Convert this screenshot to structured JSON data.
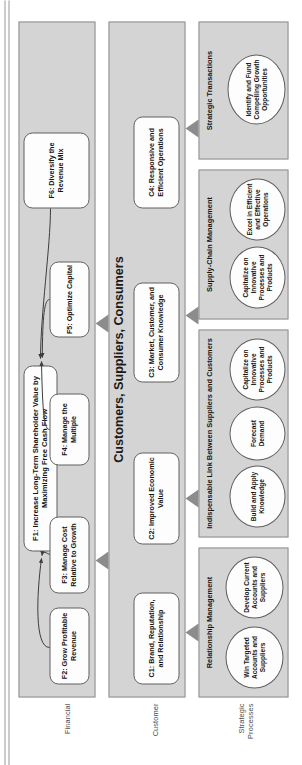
{
  "diagram": {
    "type": "strategy-map",
    "orientation": "rotated-90-ccw",
    "colors": {
      "band_fill": "#d4d4d4",
      "band_stroke": "#8e8e8e",
      "box_fill": "#fdfdfd",
      "box_stroke": "#5f5f5f",
      "arrow_fill": "#8c8c8c",
      "text": "#141414",
      "row_label_text": "#4d4d4d"
    }
  },
  "row_labels": [
    {
      "label": "Financial"
    },
    {
      "label": "Customer"
    },
    {
      "label": "Strategic\nProcesses"
    }
  ],
  "perspectives": {
    "financial": {
      "title": "",
      "objectives": [
        {
          "id": "F1",
          "label": "F1: Increase Long-Term Shareholder Value by Maximizing Free Cash Flow"
        },
        {
          "id": "F2",
          "label": "F2: Grow Profitable Revenue"
        },
        {
          "id": "F3",
          "label": "F3: Manage Cost Relative to Growth"
        },
        {
          "id": "F4",
          "label": "F4: Manage the Multiple"
        },
        {
          "id": "F5",
          "label": "F5: Optimize Capital"
        },
        {
          "id": "F6",
          "label": "F6: Diversify the Revenue Mix"
        }
      ]
    },
    "customer": {
      "title": "Customers, Suppliers, Consumers",
      "objectives": [
        {
          "id": "C1",
          "label": "C1: Brand, Reputation, and Relationship"
        },
        {
          "id": "C2",
          "label": "C2: Improved Economic Value"
        },
        {
          "id": "C3",
          "label": "C3: Market, Customer, and Consumer Knowledge"
        },
        {
          "id": "C4",
          "label": "C4: Responsive and Efficient Operations"
        }
      ]
    },
    "strategic_processes": {
      "title": "",
      "groups": [
        {
          "name": "Relationship Management",
          "items": [
            {
              "label": "Win Targeted Accounts and Suppliers"
            },
            {
              "label": "Develop Current Accounts and Suppliers"
            }
          ]
        },
        {
          "name": "Indispensable Link Between Suppliers and Customers",
          "items": [
            {
              "label": "Build and Apply Knowledge"
            },
            {
              "label": "Forecast Demand"
            },
            {
              "label": "Capitalize on Innovative Processes and Products"
            }
          ]
        },
        {
          "name": "Supply-Chain Management",
          "items": [
            {
              "label": "Capitalize on Innovative Processes and Products"
            },
            {
              "label": "Excel in Efficient and Effective Operations"
            }
          ]
        },
        {
          "name": "Strategic Transactions",
          "items": [
            {
              "label": "Identify and Fund Compelling Growth Opportunities"
            }
          ]
        }
      ]
    }
  }
}
